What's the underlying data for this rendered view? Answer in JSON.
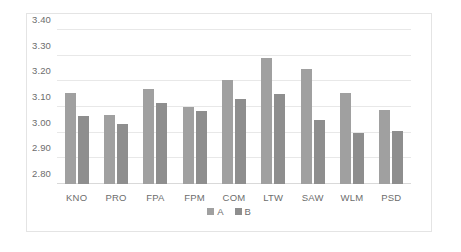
{
  "chart_data": {
    "type": "bar",
    "title": "",
    "xlabel": "",
    "ylabel": "",
    "ylim": [
      2.8,
      3.4
    ],
    "ytick_step": 0.1,
    "ytick_labels": [
      "3.40",
      "3.30",
      "3.20",
      "3.10",
      "3.00",
      "2.90",
      "2.80"
    ],
    "ytick_values": [
      3.4,
      3.3,
      3.2,
      3.1,
      3.0,
      2.9,
      2.8
    ],
    "grid": true,
    "legend_position": "bottom",
    "categories": [
      "KNO",
      "PRO",
      "FPA",
      "FPM",
      "COM",
      "LTW",
      "SAW",
      "WLM",
      "PSD"
    ],
    "series": [
      {
        "name": "A",
        "color": "#a0a0a0",
        "values": [
          3.155,
          3.07,
          3.17,
          3.1,
          3.205,
          3.29,
          3.25,
          3.155,
          3.09
        ]
      },
      {
        "name": "B",
        "color": "#8e8e8e",
        "values": [
          3.065,
          3.035,
          3.115,
          3.085,
          3.13,
          3.15,
          3.05,
          3.0,
          3.005
        ]
      }
    ]
  },
  "legend": {
    "items": [
      {
        "label": "A",
        "color": "#a0a0a0"
      },
      {
        "label": "B",
        "color": "#8e8e8e"
      }
    ]
  },
  "style": {
    "border_color": "#e4e4e4",
    "gridline_color": "#e8e8e8",
    "text_color": "#6d6d6d",
    "background": "#ffffff"
  }
}
